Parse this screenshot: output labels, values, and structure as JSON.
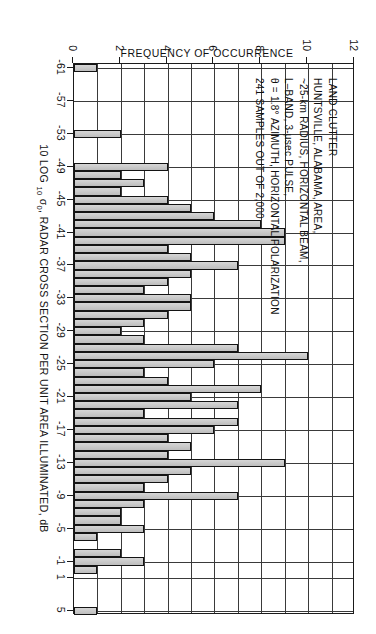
{
  "figure": {
    "kind": "histogram-figure",
    "orientation_note": "landscape figure, scanned rotated 90 degrees counter-clockwise"
  },
  "annotation": {
    "lines": [
      "LAND CLUTTER",
      "HUNTSVILLE, ALABAMA, AREA,",
      "~25-km RADIUS, HORIZONTAL BEAM,",
      "L–BAND, 3-µsec PULSE,",
      "θ = 1.8° AZIMUTH, HORIZONTAL POLARIZATION",
      "241 SAMPLES OUT OF 2,000"
    ]
  },
  "chart_data": {
    "type": "bar",
    "title": "",
    "xlabel": "10 LOG 10 σ0, RADAR CROSS SECTION PER UNIT AREA ILLUMINATED, dB",
    "ylabel": "FREQUENCY OF OCCURRENCE",
    "xlim": [
      -61.5,
      5.5
    ],
    "ylim": [
      0,
      12
    ],
    "grid": true,
    "legend": "none",
    "xtick_labels": [
      "-61",
      "-57",
      "-53",
      "-49",
      "-45",
      "-41",
      "-37",
      "-33",
      "-29",
      "-25",
      "-21",
      "-17",
      "-13",
      "-9",
      "-5",
      "-1",
      "1",
      "5"
    ],
    "xtick_values": [
      -61,
      -57,
      -53,
      -49,
      -45,
      -41,
      -37,
      -33,
      -29,
      -25,
      -21,
      -17,
      -13,
      -9,
      -5,
      -1,
      1,
      5
    ],
    "ytick_labels": [
      "0",
      "2",
      "4",
      "6",
      "8",
      "10",
      "12"
    ],
    "ytick_values": [
      0,
      2,
      4,
      6,
      8,
      10,
      12
    ],
    "bin_width_db": 1,
    "categories": [
      -61,
      -60,
      -59,
      -58,
      -57,
      -56,
      -55,
      -54,
      -53,
      -52,
      -51,
      -50,
      -49,
      -48,
      -47,
      -46,
      -45,
      -44,
      -43,
      -42,
      -41,
      -40,
      -39,
      -38,
      -37,
      -36,
      -35,
      -34,
      -33,
      -32,
      -31,
      -30,
      -29,
      -28,
      -27,
      -26,
      -25,
      -24,
      -23,
      -22,
      -21,
      -20,
      -19,
      -18,
      -17,
      -16,
      -15,
      -14,
      -13,
      -12,
      -11,
      -10,
      -9,
      -8,
      -7,
      -6,
      -5,
      -4,
      -3,
      -2,
      -1,
      0,
      1,
      2,
      3,
      4,
      5
    ],
    "values": [
      1,
      0,
      0,
      0,
      0,
      0,
      0,
      0,
      2,
      0,
      0,
      0,
      4,
      2,
      3,
      2,
      4,
      5,
      6,
      8,
      9,
      9,
      4,
      5,
      7,
      5,
      4,
      3,
      5,
      5,
      4,
      3,
      2,
      3,
      7,
      10,
      6,
      3,
      4,
      8,
      5,
      7,
      3,
      7,
      6,
      4,
      5,
      4,
      9,
      5,
      4,
      3,
      7,
      3,
      2,
      2,
      3,
      1,
      0,
      2,
      3,
      1,
      0,
      0,
      0,
      0,
      1
    ]
  }
}
